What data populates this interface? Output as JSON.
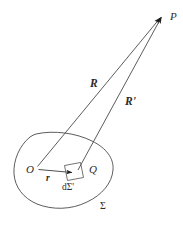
{
  "figure": {
    "background_color": "#ffffff",
    "stroke_color": "#3a3a3a",
    "label_color": "#2b2b2b",
    "labels": {
      "point_p": "P",
      "point_o": "O",
      "point_q": "Q",
      "vector_r_big": "R",
      "vector_r_big_prime": "R'",
      "vector_r_small": "r",
      "surface_element": "dΣ'",
      "surface": "Σ"
    },
    "geometry": {
      "field_point": {
        "x": 163,
        "y": 14
      },
      "origin_point": {
        "x": 36,
        "y": 168
      },
      "element_point": {
        "x": 76,
        "y": 172
      },
      "blob_center": {
        "x": 64,
        "y": 170
      },
      "blob_width": 100,
      "blob_height": 76,
      "patch_size": 16
    }
  }
}
